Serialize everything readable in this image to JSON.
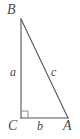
{
  "figure": {
    "kind": "right-triangle-diagram",
    "background_color": "#ffffff",
    "stroke_color": "#555555",
    "text_color": "#4a4a4a",
    "vertices": [
      {
        "id": "B",
        "label": "B",
        "x": 21,
        "y": 19
      },
      {
        "id": "C",
        "label": "C",
        "x": 21,
        "y": 118
      },
      {
        "id": "A",
        "label": "A",
        "x": 68,
        "y": 118
      }
    ],
    "sides": [
      {
        "id": "a",
        "label": "a",
        "from": "B",
        "to": "C",
        "role": "vertical-leg"
      },
      {
        "id": "b",
        "label": "b",
        "from": "C",
        "to": "A",
        "role": "horizontal-leg"
      },
      {
        "id": "c",
        "label": "c",
        "from": "B",
        "to": "A",
        "role": "hypotenuse"
      }
    ],
    "right_angle": {
      "at_vertex": "C",
      "marker": "square",
      "size": 7
    }
  }
}
